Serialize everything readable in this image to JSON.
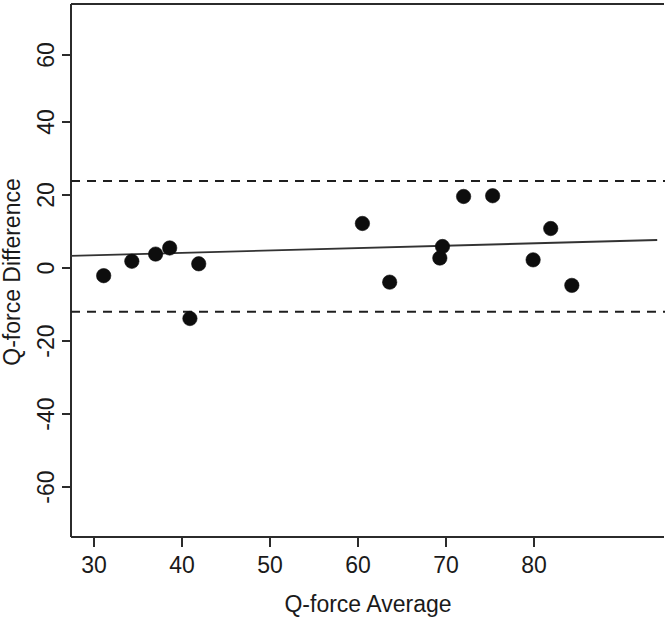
{
  "chart_data": {
    "type": "scatter",
    "title": "",
    "xlabel": "Q-force Average",
    "ylabel": "Q-force Difference",
    "xlim": [
      27.3,
      94.0
    ],
    "ylim": [
      -72.0,
      72.0
    ],
    "xticks": [
      30,
      40,
      50,
      60,
      70,
      80
    ],
    "yticks": [
      60,
      40,
      20,
      0,
      -20,
      -40,
      -60
    ],
    "xtick_labels": [
      "30",
      "40",
      "50",
      "60",
      "70",
      "80"
    ],
    "ytick_labels": [
      "60",
      "40",
      "20",
      "0",
      "-20",
      "-40",
      "-60"
    ],
    "grid": false,
    "legend": null,
    "points": [
      {
        "x": 31.1,
        "y": -1.3
      },
      {
        "x": 34.3,
        "y": 2.7
      },
      {
        "x": 37.0,
        "y": 4.7
      },
      {
        "x": 38.6,
        "y": 6.4
      },
      {
        "x": 40.9,
        "y": -13.2
      },
      {
        "x": 41.9,
        "y": 2.0
      },
      {
        "x": 60.5,
        "y": 13.2
      },
      {
        "x": 63.6,
        "y": -3.1
      },
      {
        "x": 69.3,
        "y": 3.6
      },
      {
        "x": 69.6,
        "y": 6.8
      },
      {
        "x": 72.0,
        "y": 20.7
      },
      {
        "x": 75.3,
        "y": 20.9
      },
      {
        "x": 79.9,
        "y": 3.1
      },
      {
        "x": 81.9,
        "y": 11.8
      },
      {
        "x": 84.3,
        "y": -4.0
      }
    ],
    "annotations": [
      {
        "name": "upper-limit-of-agreement",
        "type": "hline",
        "y": 25.0,
        "style": "dashed"
      },
      {
        "name": "lower-limit-of-agreement",
        "type": "hline",
        "y": -11.3,
        "style": "dashed"
      },
      {
        "name": "regression-line",
        "type": "line",
        "x0": 27.3,
        "y0": 4.2,
        "x1": 94.0,
        "y1": 8.6,
        "style": "solid"
      }
    ],
    "point_color": "#0d0d0d",
    "line_color": "#333333",
    "axis_color": "#2b2b2b"
  },
  "axes": {
    "x_title": "Q-force Average",
    "y_title": "Q-force Difference",
    "x_ticks": [
      {
        "label": "30",
        "px": 94
      },
      {
        "label": "40",
        "px": 182
      },
      {
        "label": "50",
        "px": 270
      },
      {
        "label": "60",
        "px": 358
      },
      {
        "label": "70",
        "px": 446
      },
      {
        "label": "80",
        "px": 534
      }
    ],
    "y_ticks": [
      {
        "label": "60",
        "px": 55
      },
      {
        "label": "40",
        "px": 122
      },
      {
        "label": "20",
        "px": 195
      },
      {
        "label": "0",
        "px": 268
      },
      {
        "label": "-20",
        "px": 341
      },
      {
        "label": "-40",
        "px": 414
      },
      {
        "label": "-60",
        "px": 487
      }
    ]
  }
}
